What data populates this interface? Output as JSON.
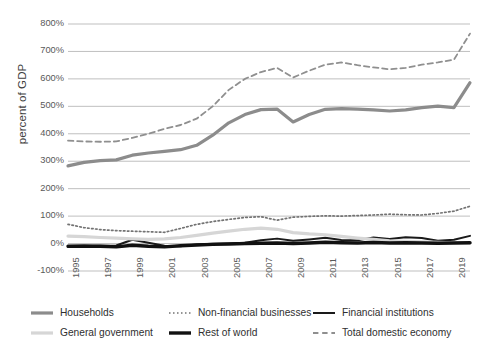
{
  "chart_data": {
    "type": "line",
    "title": "",
    "subtitle": "",
    "xlabel": "",
    "ylabel": "percent of GDP",
    "ylim": [
      -100,
      800
    ],
    "ytick_labels": [
      "800%",
      "700%",
      "600%",
      "500%",
      "400%",
      "300%",
      "200%",
      "100%",
      "0%",
      "-100%"
    ],
    "ytick_values": [
      800,
      700,
      600,
      500,
      400,
      300,
      200,
      100,
      0,
      -100
    ],
    "xtick_labels": [
      "1995",
      "1997",
      "1999",
      "2001",
      "2003",
      "2005",
      "2007",
      "2009",
      "2011",
      "2013",
      "2015",
      "2017",
      "2019"
    ],
    "xtick_values": [
      1995,
      1997,
      1999,
      2001,
      2003,
      2005,
      2007,
      2009,
      2011,
      2013,
      2015,
      2017,
      2019
    ],
    "xlim": [
      1995,
      2020
    ],
    "x": [
      1995,
      1996,
      1997,
      1998,
      1999,
      2000,
      2001,
      2002,
      2003,
      2004,
      2005,
      2006,
      2007,
      2008,
      2009,
      2010,
      2011,
      2012,
      2013,
      2014,
      2015,
      2016,
      2017,
      2018,
      2019,
      2020
    ],
    "grid": "horizontal",
    "legend_position": "bottom",
    "series": [
      {
        "name": "Households",
        "color": "#8c8c8c",
        "style": "solid",
        "width": 3.2,
        "values": [
          283,
          296,
          302,
          305,
          322,
          330,
          336,
          342,
          358,
          395,
          440,
          470,
          488,
          490,
          443,
          470,
          489,
          492,
          490,
          487,
          483,
          487,
          495,
          501,
          495,
          586
        ]
      },
      {
        "name": "Non-financial businesses",
        "color": "#737373",
        "style": "dotted",
        "width": 1.7,
        "values": [
          70,
          58,
          51,
          47,
          45,
          43,
          41,
          55,
          70,
          80,
          88,
          95,
          98,
          85,
          96,
          99,
          101,
          100,
          102,
          104,
          107,
          105,
          104,
          110,
          118,
          136
        ]
      },
      {
        "name": "Financial institutions",
        "color": "#1a1a1a",
        "style": "solid",
        "width": 2.0,
        "values": [
          -12,
          -10,
          -8,
          -7,
          14,
          3,
          -8,
          -10,
          -3,
          -1,
          1,
          3,
          12,
          18,
          10,
          15,
          21,
          13,
          12,
          22,
          17,
          23,
          20,
          10,
          14,
          28
        ]
      },
      {
        "name": "General government",
        "color": "#d6d6d6",
        "style": "solid",
        "width": 3.2,
        "values": [
          27,
          25,
          22,
          20,
          17,
          15,
          17,
          22,
          30,
          38,
          45,
          52,
          56,
          52,
          40,
          35,
          32,
          26,
          20,
          15,
          10,
          8,
          6,
          4,
          3,
          2
        ]
      },
      {
        "name": "Rest of world",
        "color": "#111111",
        "style": "solid",
        "width": 3.4,
        "values": [
          -10,
          -9,
          -10,
          -12,
          -6,
          -10,
          -12,
          -8,
          -5,
          -3,
          -2,
          0,
          1,
          2,
          0,
          2,
          5,
          3,
          2,
          4,
          2,
          3,
          2,
          1,
          2,
          3
        ]
      },
      {
        "name": "Total domestic economy",
        "color": "#8f8f8f",
        "style": "dashed",
        "width": 1.8,
        "values": [
          375,
          372,
          371,
          372,
          385,
          400,
          418,
          432,
          455,
          500,
          560,
          600,
          625,
          640,
          605,
          630,
          652,
          660,
          650,
          642,
          635,
          640,
          652,
          660,
          670,
          765
        ]
      }
    ]
  },
  "axis": {
    "y_title": "percent of GDP"
  },
  "legend": {
    "items": [
      {
        "label": "Households",
        "key": "households"
      },
      {
        "label": "Non-financial businesses",
        "key": "non-financial-businesses"
      },
      {
        "label": "Financial institutions",
        "key": "financial-institutions"
      },
      {
        "label": "General government",
        "key": "general-government"
      },
      {
        "label": "Rest of world",
        "key": "rest-of-world"
      },
      {
        "label": "Total domestic economy",
        "key": "total-domestic-economy"
      }
    ]
  }
}
